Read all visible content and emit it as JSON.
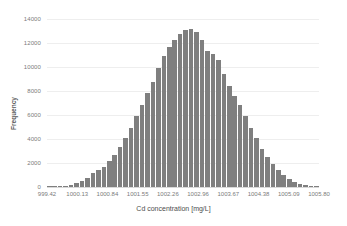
{
  "chart_data": {
    "type": "bar",
    "title": "",
    "subtitle": "",
    "xlabel": "Cd concentration [mg/L]",
    "ylabel": "Frequency",
    "xlim": [
      999.42,
      1005.8
    ],
    "ylim": [
      0,
      14000
    ],
    "grid": true,
    "legend": null,
    "legend_position": "none",
    "bar_color": "#7f7f7f",
    "gridline_color": "#eeeeee",
    "axis_text_color": "#7b7b7b",
    "x_tick_labels": [
      "999.42",
      "1000.13",
      "1000.84",
      "1001.55",
      "1002.26",
      "1002.96",
      "1003.67",
      "1004.38",
      "1005.09",
      "1005.80"
    ],
    "y_tick_labels": [
      "0",
      "2000",
      "4000",
      "6000",
      "8000",
      "10000",
      "12000",
      "14000"
    ],
    "y_tick_values": [
      0,
      2000,
      4000,
      6000,
      8000,
      10000,
      12000,
      14000
    ],
    "bin_count": 50,
    "bin_centers": [
      999.48,
      999.61,
      999.74,
      999.87,
      1000.0,
      1000.13,
      1000.26,
      1000.39,
      1000.52,
      1000.65,
      1000.78,
      1000.91,
      1001.04,
      1001.17,
      1001.3,
      1001.43,
      1001.56,
      1001.69,
      1001.82,
      1001.95,
      1002.08,
      1002.21,
      1002.34,
      1002.47,
      1002.6,
      1002.73,
      1002.86,
      1002.99,
      1003.12,
      1003.25,
      1003.38,
      1003.51,
      1003.64,
      1003.77,
      1003.9,
      1004.03,
      1004.16,
      1004.29,
      1004.42,
      1004.55,
      1004.68,
      1004.81,
      1004.94,
      1005.07,
      1005.2,
      1005.33,
      1005.46,
      1005.59,
      1005.72,
      1005.85
    ],
    "values": [
      20,
      40,
      70,
      120,
      200,
      330,
      520,
      790,
      1150,
      1400,
      1650,
      2150,
      2700,
      3350,
      4100,
      4950,
      5900,
      6850,
      7800,
      8750,
      9900,
      10950,
      11650,
      12250,
      12750,
      13100,
      13150,
      12950,
      12250,
      11350,
      11100,
      10550,
      9400,
      8450,
      7550,
      6800,
      5900,
      4950,
      4050,
      3200,
      2500,
      1900,
      1400,
      1000,
      700,
      450,
      280,
      170,
      90,
      40
    ],
    "peak_value": 13150,
    "peak_position": 1002.86
  },
  "axis": {
    "y_title": "Frequency",
    "x_title": "Cd concentration [mg/L]"
  }
}
